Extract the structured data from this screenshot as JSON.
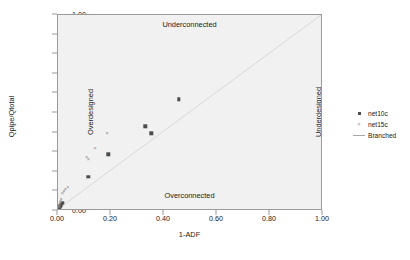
{
  "chart_data": {
    "type": "scatter",
    "title": "",
    "xlabel": "1-ADF",
    "ylabel": "Qpipe/Qtotal",
    "xlim": [
      0.0,
      1.0
    ],
    "ylim": [
      0.0,
      1.0
    ],
    "grid": false,
    "plot_background": "#f1f1f1",
    "legend_position": "right",
    "xticks": [
      "0.00",
      "0.20",
      "0.40",
      "0.60",
      "0.80",
      "1.00"
    ],
    "xtick_values": [
      0.0,
      0.2,
      0.4,
      0.6,
      0.8,
      1.0
    ],
    "yticks": [
      "0.00",
      "0.10",
      "0.20",
      "0.30",
      "0.40",
      "0.50",
      "0.60",
      "0.70",
      "0.80",
      "0.90",
      "1.00"
    ],
    "ytick_values": [
      0.0,
      0.1,
      0.2,
      0.3,
      0.4,
      0.5,
      0.6,
      0.7,
      0.8,
      0.9,
      1.0
    ],
    "annotations": [
      {
        "text": "Underconnected",
        "position": "top-center"
      },
      {
        "text": "Overconnected",
        "position": "bottom-center"
      },
      {
        "text": "Overdesigned",
        "position": "left-rotated"
      },
      {
        "text": "Underdesigned",
        "position": "right-rotated"
      }
    ],
    "series": [
      {
        "name": "net10c",
        "marker": "square",
        "color": "#4c4c4c",
        "points": [
          [
            0.455,
            0.57
          ],
          [
            0.33,
            0.432
          ],
          [
            0.352,
            0.396
          ],
          [
            0.19,
            0.289
          ],
          [
            0.115,
            0.176
          ],
          [
            0.018,
            0.042
          ],
          [
            0.014,
            0.036
          ],
          [
            0.01,
            0.03
          ],
          [
            0.008,
            0.026
          ],
          [
            0.006,
            0.022
          ],
          [
            0.005,
            0.018
          ],
          [
            0.004,
            0.014
          ],
          [
            0.003,
            0.01
          ],
          [
            0.002,
            0.006
          ]
        ]
      },
      {
        "name": "net15c",
        "marker": "x",
        "color": "#8d8d8d",
        "points": [
          [
            0.185,
            0.4
          ],
          [
            0.14,
            0.32
          ],
          [
            0.108,
            0.277
          ],
          [
            0.114,
            0.265
          ],
          [
            0.037,
            0.122
          ],
          [
            0.028,
            0.112
          ],
          [
            0.022,
            0.1
          ],
          [
            0.016,
            0.092
          ],
          [
            0.012,
            0.062
          ],
          [
            0.01,
            0.052
          ],
          [
            0.008,
            0.046
          ],
          [
            0.006,
            0.038
          ],
          [
            0.004,
            0.028
          ],
          [
            0.003,
            0.02
          ]
        ]
      },
      {
        "name": "Branched",
        "marker": "line",
        "color": "#a8a8a8",
        "line_from": [
          0.0,
          0.0
        ],
        "line_to": [
          1.0,
          1.0
        ]
      }
    ]
  },
  "legend": {
    "entries": [
      {
        "label": "net10c",
        "key": "square-marker-icon"
      },
      {
        "label": "net15c",
        "key": "x-marker-icon"
      },
      {
        "label": "Branched",
        "key": "line-marker-icon"
      }
    ]
  }
}
